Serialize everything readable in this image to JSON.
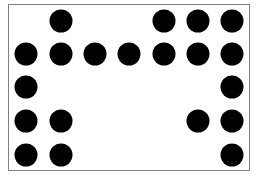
{
  "diagram": {
    "type": "dot-grid",
    "columns": 7,
    "rows": 5,
    "dot_color": "#000000",
    "border_color": "#808080",
    "background_color": "#ffffff",
    "grid": [
      [
        0,
        1,
        0,
        0,
        1,
        1,
        1
      ],
      [
        1,
        1,
        1,
        1,
        1,
        1,
        1
      ],
      [
        1,
        0,
        0,
        0,
        0,
        0,
        1
      ],
      [
        1,
        1,
        0,
        0,
        0,
        1,
        1
      ],
      [
        1,
        1,
        0,
        0,
        0,
        0,
        1
      ]
    ],
    "col_centers_px": [
      26,
      61,
      95,
      129,
      164,
      198,
      232
    ],
    "row_centers_px": [
      21,
      54,
      87,
      121,
      155
    ]
  }
}
